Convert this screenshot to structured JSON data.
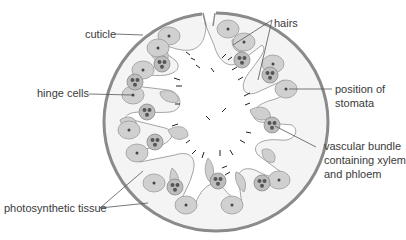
{
  "diagram": {
    "labels": {
      "cuticle": "cuticle",
      "hairs": "hairs",
      "hinge_cells": "hinge cells",
      "stomata_line1": "position of",
      "stomata_line2": "stomata",
      "vascular_line1": "vascular bundle",
      "vascular_line2": "containing xylem",
      "vascular_line3": "and phloem",
      "photosynthetic": "photosynthetic tissue"
    },
    "colors": {
      "cuticle": "#8a8a8a",
      "leaf_fill": "#f3f3f3",
      "tissue_fill": "#cfcfcf",
      "tissue_stroke": "#9a9a9a",
      "line": "#555555",
      "text": "#3a3a3a"
    }
  }
}
